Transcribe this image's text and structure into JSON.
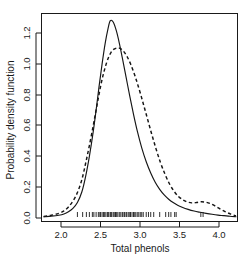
{
  "chart_data": {
    "type": "line",
    "title": "",
    "xlabel": "Total phenols",
    "ylabel": "Probability density function",
    "xlim": [
      1.72,
      4.34
    ],
    "ylim": [
      0.0,
      1.34
    ],
    "grid": false,
    "legend": "none",
    "xticks": [
      2.0,
      2.5,
      3.0,
      3.5,
      4.0
    ],
    "xtick_labels": [
      "2.0",
      "2.5",
      "3.0",
      "3.5",
      "4.0"
    ],
    "yticks": [
      0.0,
      0.2,
      0.4,
      0.6,
      0.8,
      1.0,
      1.2
    ],
    "ytick_labels": [
      "0.0",
      "0.2",
      "0.4",
      "0.6",
      "0.8",
      "1.0",
      "1.2"
    ],
    "series": [
      {
        "name": "solid-density",
        "style": "solid",
        "color": "#151515",
        "peak_x": 2.64,
        "peak_y": 1.28,
        "x": [
          1.75,
          1.85,
          1.95,
          2.02,
          2.08,
          2.14,
          2.2,
          2.26,
          2.31,
          2.36,
          2.41,
          2.45,
          2.49,
          2.53,
          2.57,
          2.61,
          2.64,
          2.68,
          2.72,
          2.76,
          2.8,
          2.85,
          2.9,
          2.95,
          3.0,
          3.06,
          3.12,
          3.18,
          3.24,
          3.3,
          3.36,
          3.42,
          3.48,
          3.54,
          3.6,
          3.68,
          3.76,
          3.84,
          3.92,
          4.0,
          4.08,
          4.16,
          4.24,
          4.32
        ],
        "y": [
          0.008,
          0.012,
          0.018,
          0.026,
          0.04,
          0.062,
          0.1,
          0.17,
          0.27,
          0.4,
          0.555,
          0.7,
          0.855,
          1.0,
          1.13,
          1.23,
          1.28,
          1.27,
          1.215,
          1.135,
          1.04,
          0.915,
          0.79,
          0.672,
          0.565,
          0.455,
          0.365,
          0.292,
          0.232,
          0.186,
          0.15,
          0.122,
          0.1,
          0.083,
          0.07,
          0.056,
          0.045,
          0.037,
          0.03,
          0.024,
          0.019,
          0.015,
          0.011,
          0.008
        ]
      },
      {
        "name": "dashed-density",
        "style": "dashed",
        "color": "#151515",
        "peak_x": 2.77,
        "peak_y": 1.1,
        "secondary_bump_x": 3.85,
        "secondary_bump_y": 0.105,
        "x": [
          1.75,
          1.85,
          1.95,
          2.02,
          2.08,
          2.14,
          2.2,
          2.26,
          2.31,
          2.36,
          2.41,
          2.45,
          2.49,
          2.53,
          2.57,
          2.61,
          2.65,
          2.69,
          2.73,
          2.77,
          2.81,
          2.86,
          2.91,
          2.96,
          3.01,
          3.07,
          3.13,
          3.19,
          3.25,
          3.31,
          3.37,
          3.43,
          3.49,
          3.55,
          3.61,
          3.67,
          3.73,
          3.79,
          3.85,
          3.91,
          3.97,
          4.04,
          4.11,
          4.18,
          4.25,
          4.32
        ],
        "y": [
          0.01,
          0.018,
          0.03,
          0.046,
          0.072,
          0.11,
          0.165,
          0.25,
          0.355,
          0.47,
          0.595,
          0.7,
          0.805,
          0.9,
          0.975,
          1.035,
          1.075,
          1.095,
          1.102,
          1.1,
          1.085,
          1.05,
          1.0,
          0.935,
          0.86,
          0.76,
          0.655,
          0.55,
          0.45,
          0.36,
          0.285,
          0.222,
          0.175,
          0.14,
          0.118,
          0.104,
          0.098,
          0.1,
          0.105,
          0.103,
          0.095,
          0.078,
          0.058,
          0.04,
          0.025,
          0.014
        ]
      }
    ],
    "rug": {
      "name": "data-rug-marks",
      "values": [
        2.2,
        2.27,
        2.32,
        2.36,
        2.4,
        2.42,
        2.45,
        2.48,
        2.5,
        2.51,
        2.53,
        2.55,
        2.56,
        2.58,
        2.6,
        2.61,
        2.62,
        2.64,
        2.65,
        2.66,
        2.68,
        2.7,
        2.71,
        2.72,
        2.74,
        2.76,
        2.78,
        2.8,
        2.81,
        2.83,
        2.85,
        2.86,
        2.88,
        2.9,
        2.91,
        2.93,
        2.95,
        2.96,
        2.98,
        3.0,
        3.02,
        3.04,
        3.06,
        3.08,
        3.12,
        3.15,
        3.18,
        3.22,
        3.3,
        3.38,
        3.42,
        3.45,
        3.5,
        3.52,
        3.85,
        3.88
      ]
    }
  }
}
